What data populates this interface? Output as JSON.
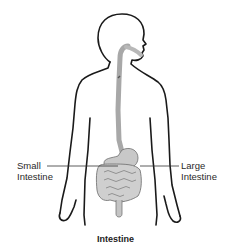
{
  "diagram": {
    "title": "Intestine",
    "labels": {
      "small_intestine": [
        "Small",
        "Intestine"
      ],
      "large_intestine": [
        "Large",
        "Intestine"
      ]
    },
    "colors": {
      "outline": "#1a1a1a",
      "organ_fill": "#cfcfcf",
      "organ_shade": "#9a9a9a",
      "leader_line": "#333333",
      "background": "#ffffff"
    }
  }
}
